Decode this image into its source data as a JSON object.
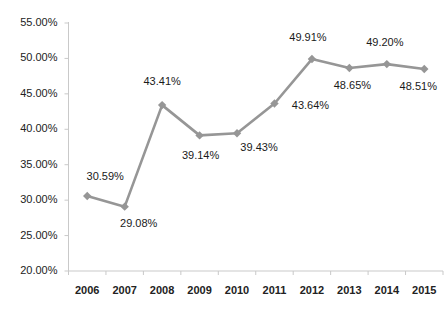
{
  "chart_data": {
    "type": "line",
    "title": "",
    "subtitle": "",
    "xlabel": "",
    "ylabel": "",
    "categories": [
      "2006",
      "2007",
      "2008",
      "2009",
      "2010",
      "2011",
      "2012",
      "2013",
      "2014",
      "2015"
    ],
    "values": [
      30.59,
      29.08,
      43.41,
      39.14,
      39.43,
      43.64,
      49.91,
      48.65,
      49.2,
      48.51
    ],
    "point_labels": [
      "30.59%",
      "29.08%",
      "43.41%",
      "39.14%",
      "39.43%",
      "43.64%",
      "49.91%",
      "48.65%",
      "49.20%",
      "48.51%"
    ],
    "ylim": [
      20.0,
      55.0
    ],
    "y_tick_values": [
      20.0,
      25.0,
      30.0,
      35.0,
      40.0,
      45.0,
      50.0,
      55.0
    ],
    "y_tick_labels": [
      "20.00%",
      "25.00%",
      "30.00%",
      "35.00%",
      "40.00%",
      "45.00%",
      "50.00%",
      "55.00%"
    ],
    "grid": false,
    "legend": "none",
    "series_color": "#969696",
    "marker": "diamond",
    "label_color": "#1a1a1a",
    "axis_color": "#c9c9c9",
    "background": "#ffffff",
    "label_offsets": [
      {
        "dx": 18,
        "dy": -20
      },
      {
        "dx": 14,
        "dy": 16
      },
      {
        "dx": 0,
        "dy": -24
      },
      {
        "dx": 1,
        "dy": 20
      },
      {
        "dx": 22,
        "dy": 14
      },
      {
        "dx": 36,
        "dy": 2
      },
      {
        "dx": -4,
        "dy": -22
      },
      {
        "dx": 3,
        "dy": 17
      },
      {
        "dx": -2,
        "dy": -22
      },
      {
        "dx": -6,
        "dy": 17
      }
    ]
  },
  "ticks": {
    "y_labels": [
      "55.00%",
      "50.00%",
      "45.00%",
      "40.00%",
      "35.00%",
      "30.00%",
      "25.00%",
      "20.00%"
    ],
    "x_labels": [
      "2006",
      "2007",
      "2008",
      "2009",
      "2010",
      "2011",
      "2012",
      "2013",
      "2014",
      "2015"
    ]
  }
}
